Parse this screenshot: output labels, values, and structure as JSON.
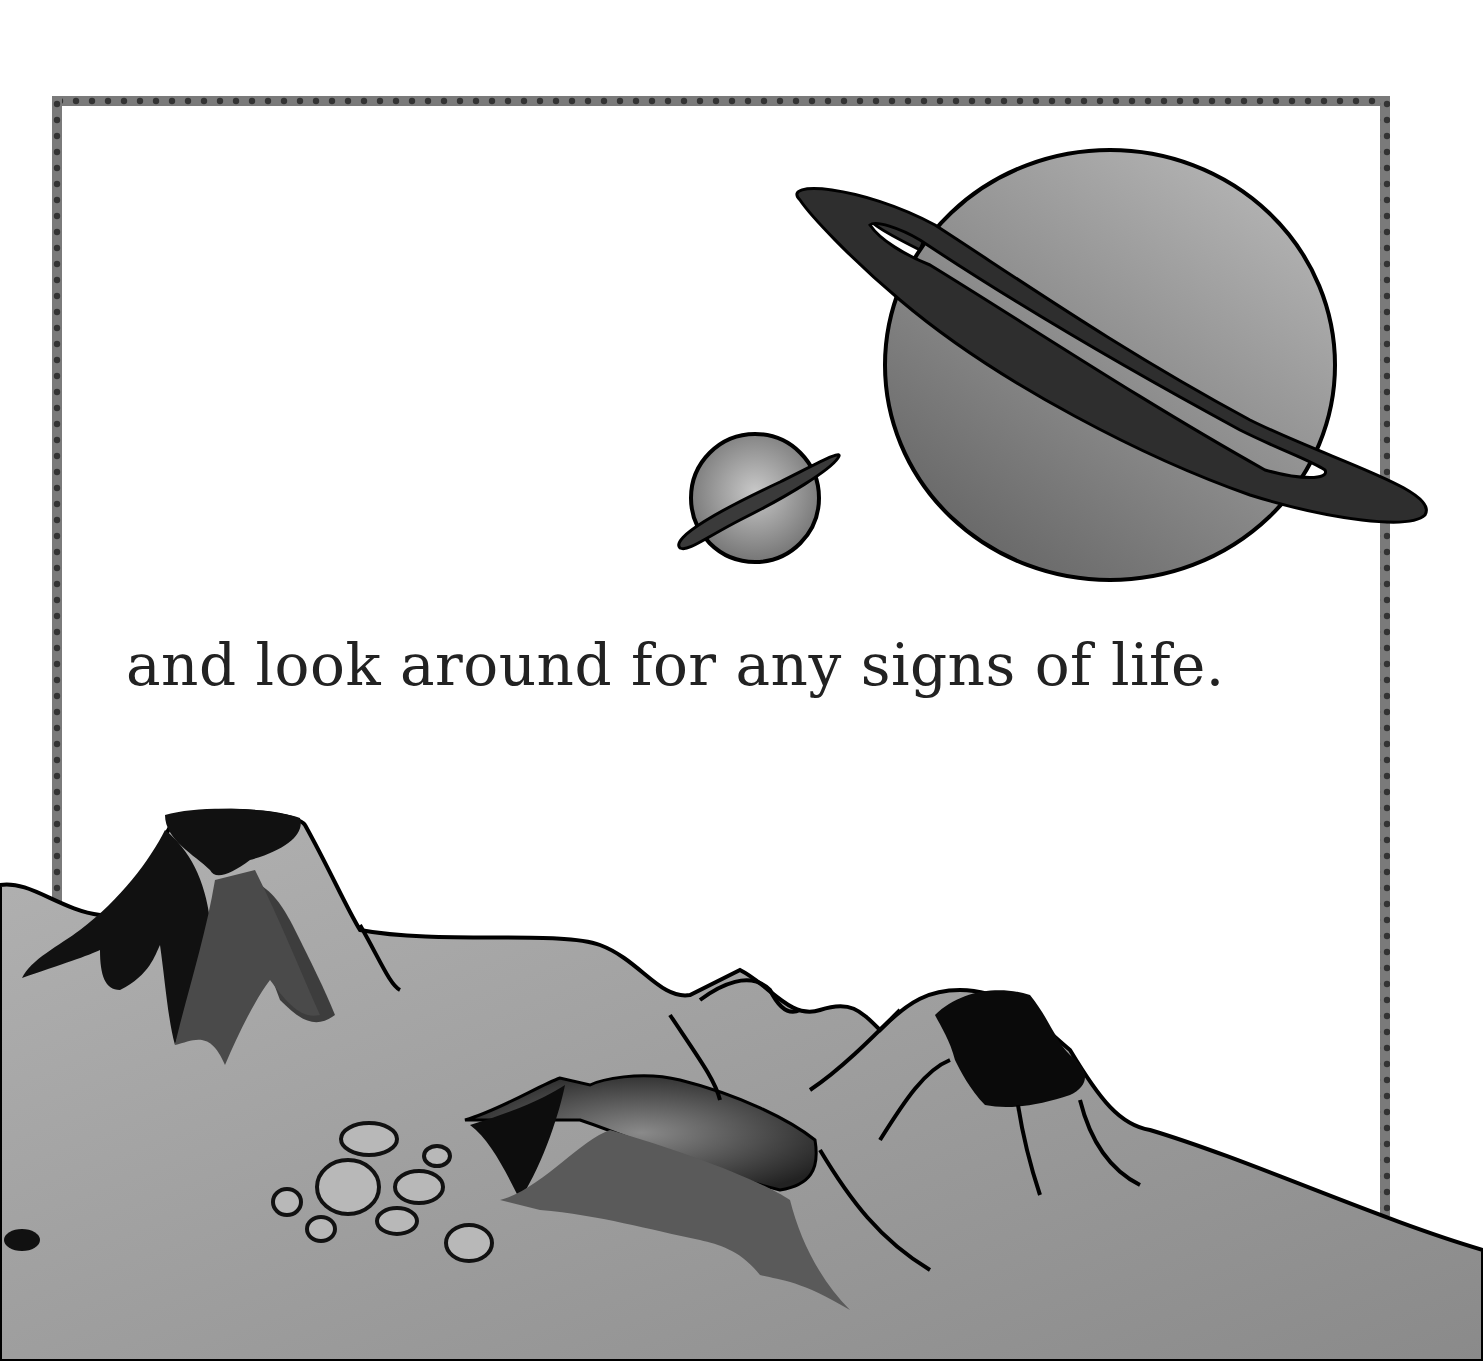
{
  "page": {
    "caption": "and look around for any signs of life.",
    "colors": {
      "background": "#ffffff",
      "frame_border": "#7a7a7a",
      "frame_dots": "#333333",
      "ground": "#a8a8a8",
      "planet_fill": "#8f8f8f",
      "ring": "#2a2a2a",
      "outline": "#000000"
    }
  },
  "illustration": {
    "planets": [
      {
        "name": "large-ringed-planet"
      },
      {
        "name": "small-ringed-planet"
      }
    ],
    "landscape": {
      "volcanoes": 3,
      "craters": 9
    }
  }
}
